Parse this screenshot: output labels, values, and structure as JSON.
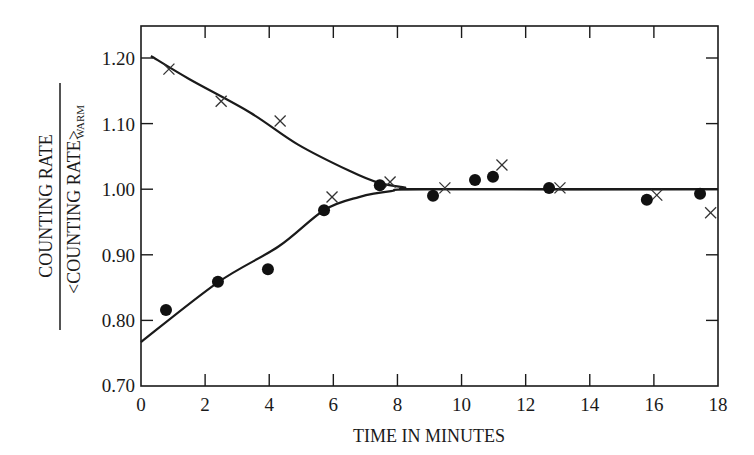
{
  "chart_data": {
    "type": "scatter",
    "title": "",
    "xlabel": "TIME IN MINUTES",
    "ylabel": {
      "numerator": "COUNTING RATE",
      "denominator": "<COUNTING RATE>",
      "denominator_subscript": "WARM"
    },
    "xlim": [
      0,
      18
    ],
    "ylim": [
      0.7,
      1.25
    ],
    "x_ticks": [
      0,
      2,
      4,
      6,
      8,
      10,
      12,
      14,
      16,
      18
    ],
    "x_tick_labels": [
      "0",
      "2",
      "4",
      "6",
      "8",
      "10",
      "12",
      "14",
      "16",
      "18"
    ],
    "y_ticks": [
      0.7,
      0.8,
      0.9,
      1.0,
      1.1,
      1.2
    ],
    "y_tick_labels": [
      "0.70",
      "0.80",
      "0.90",
      "1.00",
      "1.10",
      "1.20"
    ],
    "grid": false,
    "legend": null,
    "series": [
      {
        "name": "crosses",
        "marker": "x",
        "points": [
          {
            "x": 0.87,
            "y": 1.183
          },
          {
            "x": 2.5,
            "y": 1.134
          },
          {
            "x": 4.34,
            "y": 1.104
          },
          {
            "x": 5.96,
            "y": 0.988
          },
          {
            "x": 7.77,
            "y": 1.011
          },
          {
            "x": 9.48,
            "y": 1.002
          },
          {
            "x": 11.26,
            "y": 1.037
          },
          {
            "x": 13.07,
            "y": 1.002
          },
          {
            "x": 16.09,
            "y": 0.991
          },
          {
            "x": 17.77,
            "y": 0.964
          }
        ]
      },
      {
        "name": "dots",
        "marker": "filled-circle",
        "points": [
          {
            "x": 0.78,
            "y": 0.816
          },
          {
            "x": 2.4,
            "y": 0.859
          },
          {
            "x": 3.96,
            "y": 0.878
          },
          {
            "x": 5.71,
            "y": 0.968
          },
          {
            "x": 7.45,
            "y": 1.006
          },
          {
            "x": 9.11,
            "y": 0.99
          },
          {
            "x": 10.42,
            "y": 1.014
          },
          {
            "x": 10.98,
            "y": 1.019
          },
          {
            "x": 12.73,
            "y": 1.002
          },
          {
            "x": 15.78,
            "y": 0.984
          },
          {
            "x": 17.44,
            "y": 0.993
          }
        ]
      }
    ],
    "curves": [
      {
        "name": "upper-fit-curve",
        "points": [
          {
            "x": 0.31,
            "y": 1.203
          },
          {
            "x": 1.5,
            "y": 1.168
          },
          {
            "x": 3.4,
            "y": 1.117
          },
          {
            "x": 4.9,
            "y": 1.068
          },
          {
            "x": 6.5,
            "y": 1.028
          },
          {
            "x": 7.4,
            "y": 1.01
          },
          {
            "x": 8.2,
            "y": 1.003
          },
          {
            "x": 9.0,
            "y": 1.0
          },
          {
            "x": 18.0,
            "y": 1.0
          }
        ]
      },
      {
        "name": "lower-fit-curve",
        "points": [
          {
            "x": 0.0,
            "y": 0.767
          },
          {
            "x": 2.4,
            "y": 0.858
          },
          {
            "x": 4.3,
            "y": 0.913
          },
          {
            "x": 5.71,
            "y": 0.968
          },
          {
            "x": 6.8,
            "y": 0.988
          },
          {
            "x": 7.8,
            "y": 0.997
          },
          {
            "x": 9.0,
            "y": 1.0
          },
          {
            "x": 18.0,
            "y": 1.0
          }
        ]
      }
    ]
  },
  "layout": {
    "plot": {
      "left": 141,
      "right": 718,
      "top": 26,
      "bottom": 386
    },
    "y_ref": {
      "value_top": 1.2,
      "px_top": 58,
      "px_per_unit": 656
    },
    "ink": "#1a1a1a"
  }
}
